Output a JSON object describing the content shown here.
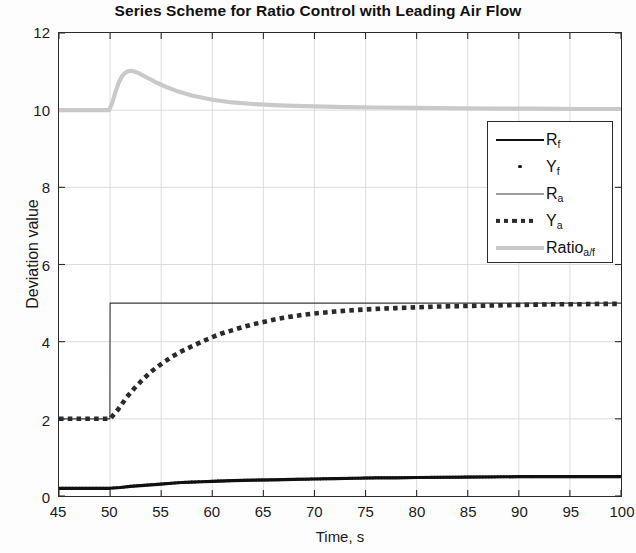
{
  "chart_data": {
    "type": "line",
    "title": "Series Scheme for Ratio Control with Leading Air Flow",
    "xlabel": "Time, s",
    "ylabel": "Deviation value",
    "xlim": [
      45,
      100
    ],
    "ylim": [
      0,
      12
    ],
    "xticks": [
      45,
      50,
      55,
      60,
      65,
      70,
      75,
      80,
      85,
      90,
      95,
      100
    ],
    "yticks": [
      0,
      2,
      4,
      6,
      8,
      10,
      12
    ],
    "grid": true,
    "legend_position": "upper right",
    "step_time": 50,
    "series": [
      {
        "name": "R_f",
        "legend_label": "R",
        "legend_sub": "f",
        "style": "solid-thick",
        "color": "#111111",
        "x": [
          45,
          46,
          47,
          48,
          49,
          50,
          51,
          52,
          53,
          54,
          55,
          56,
          57,
          58,
          59,
          60,
          62,
          64,
          66,
          68,
          70,
          72,
          74,
          76,
          78,
          80,
          85,
          90,
          95,
          100
        ],
        "values": [
          0.2,
          0.2,
          0.2,
          0.2,
          0.2,
          0.2,
          0.22,
          0.25,
          0.27,
          0.29,
          0.31,
          0.33,
          0.35,
          0.36,
          0.37,
          0.38,
          0.4,
          0.41,
          0.42,
          0.43,
          0.44,
          0.45,
          0.46,
          0.47,
          0.47,
          0.48,
          0.49,
          0.5,
          0.5,
          0.5
        ]
      },
      {
        "name": "Y_f",
        "legend_label": "Y",
        "legend_sub": "f",
        "style": "dot-marker",
        "color": "#111111",
        "x": [
          45,
          46,
          47,
          48,
          49,
          50,
          51,
          52,
          53,
          54,
          55,
          56,
          57,
          58,
          59,
          60,
          62,
          64,
          66,
          68,
          70,
          72,
          74,
          76,
          78,
          80,
          85,
          90,
          95,
          100
        ],
        "values": [
          0.2,
          0.2,
          0.2,
          0.2,
          0.2,
          0.2,
          0.22,
          0.25,
          0.27,
          0.29,
          0.31,
          0.33,
          0.35,
          0.36,
          0.37,
          0.38,
          0.4,
          0.41,
          0.42,
          0.43,
          0.44,
          0.45,
          0.46,
          0.47,
          0.47,
          0.48,
          0.49,
          0.5,
          0.5,
          0.5
        ]
      },
      {
        "name": "R_a",
        "legend_label": "R",
        "legend_sub": "a",
        "style": "thin-solid",
        "color": "#3a3a3a",
        "x": [
          45,
          49.98,
          50,
          100
        ],
        "values": [
          2,
          2,
          5,
          5
        ]
      },
      {
        "name": "Y_a",
        "legend_label": "Y",
        "legend_sub": "a",
        "style": "dotted-thick",
        "color": "#2a2a2a",
        "x": [
          45,
          46,
          47,
          48,
          49,
          50,
          50.8,
          51.6,
          52.4,
          53.2,
          54,
          55,
          56,
          57,
          58,
          59,
          60,
          61,
          62,
          63,
          64,
          65,
          66,
          67,
          68,
          69,
          70,
          72,
          74,
          76,
          78,
          80,
          82,
          84,
          86,
          88,
          90,
          92,
          94,
          96,
          98,
          100
        ],
        "values": [
          2.0,
          2.0,
          2.0,
          2.0,
          2.0,
          2.0,
          2.25,
          2.55,
          2.8,
          3.02,
          3.22,
          3.42,
          3.6,
          3.75,
          3.88,
          4.0,
          4.12,
          4.22,
          4.3,
          4.38,
          4.45,
          4.51,
          4.57,
          4.62,
          4.66,
          4.7,
          4.73,
          4.78,
          4.82,
          4.85,
          4.87,
          4.89,
          4.91,
          4.92,
          4.93,
          4.94,
          4.95,
          4.96,
          4.97,
          4.97,
          4.98,
          4.98
        ]
      },
      {
        "name": "Ratio_a/f",
        "legend_label": "Ratio",
        "legend_sub": "a/f",
        "style": "gray-thick",
        "color": "#c9c9c9",
        "x": [
          45,
          46,
          47,
          48,
          49,
          49.9,
          50.2,
          50.5,
          50.8,
          51.1,
          51.4,
          51.7,
          52.0,
          52.4,
          52.8,
          53.2,
          53.8,
          54.5,
          55.5,
          56.5,
          58,
          60,
          62,
          64,
          66,
          68,
          70,
          73,
          76,
          80,
          84,
          88,
          92,
          96,
          100
        ],
        "values": [
          10.0,
          10.0,
          10.0,
          10.0,
          10.0,
          10.0,
          10.18,
          10.45,
          10.68,
          10.85,
          10.95,
          11.0,
          11.02,
          11.0,
          10.96,
          10.9,
          10.82,
          10.72,
          10.6,
          10.5,
          10.38,
          10.27,
          10.2,
          10.16,
          10.13,
          10.11,
          10.1,
          10.08,
          10.07,
          10.06,
          10.05,
          10.04,
          10.04,
          10.03,
          10.03
        ]
      }
    ]
  }
}
